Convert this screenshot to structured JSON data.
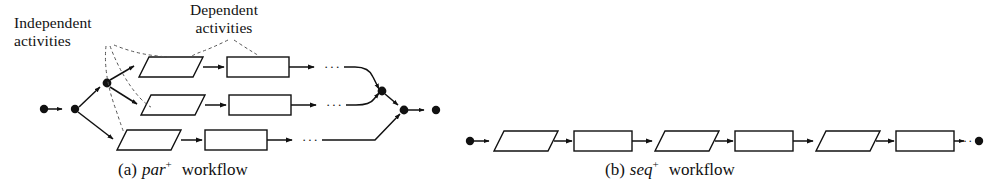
{
  "figure": {
    "background_color": "#ffffff",
    "stroke_color": "#111111",
    "dashed_color": "#555555",
    "annotations": {
      "independent": {
        "line1": "Independent",
        "line2": "activities",
        "points_to": "three-parallelogram-activities"
      },
      "dependent": {
        "line1": "Dependent",
        "line2": "activities",
        "points_to": "rectangle-activities"
      }
    },
    "panels": [
      {
        "id": "panel-a",
        "caption_prefix": "(a)",
        "caption_name": "par",
        "caption_superscript": "+",
        "caption_suffix": "workflow",
        "type": "parallel-workflow",
        "start_nodes": 2,
        "end_nodes": 2,
        "branch_count": 3,
        "branches": [
          {
            "index": 1,
            "nodes": [
              "parallelogram",
              "rectangle",
              "ellipsis"
            ]
          },
          {
            "index": 2,
            "nodes": [
              "parallelogram",
              "rectangle",
              "ellipsis"
            ]
          },
          {
            "index": 3,
            "nodes": [
              "parallelogram",
              "rectangle",
              "ellipsis"
            ]
          }
        ],
        "join_nodes": 2,
        "ellipsis_glyph": "···"
      },
      {
        "id": "panel-b",
        "caption_prefix": "(b)",
        "caption_name": "seq",
        "caption_superscript": "+",
        "caption_suffix": "workflow",
        "type": "sequential-workflow",
        "start_nodes": 1,
        "end_nodes": 1,
        "nodes": [
          "parallelogram",
          "rectangle",
          "parallelogram",
          "rectangle",
          "parallelogram",
          "rectangle",
          "ellipsis"
        ],
        "ellipsis_glyph": "···"
      }
    ]
  }
}
